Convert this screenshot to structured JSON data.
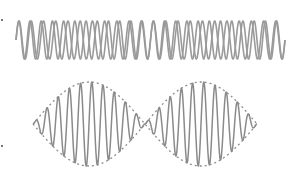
{
  "figure": {
    "colors": {
      "background": "#ffffff",
      "wave_stroke": "#8a8a8a",
      "top_wave_stroke": "#9a9a9a",
      "envelope_stroke": "#8c8c8c"
    },
    "top_panel": {
      "label": "component-waves",
      "x_start": 16,
      "x_end": 285,
      "center_y": 40,
      "amplitude": 19,
      "waves": [
        {
          "name": "wave-1",
          "cycles": 22,
          "phase": 0
        },
        {
          "name": "wave-2",
          "cycles": 24,
          "phase": 0
        }
      ]
    },
    "bottom_panel": {
      "label": "resultant-beat-wave",
      "x_start": 33,
      "x_end": 257,
      "center_y": 124,
      "amplitude": 42,
      "beat_lobes": 2,
      "carrier_cycles": 20,
      "envelope_dash": "2 3"
    },
    "edge_marks": [
      {
        "x": 1,
        "y": 19
      },
      {
        "x": 1,
        "y": 145
      }
    ]
  }
}
